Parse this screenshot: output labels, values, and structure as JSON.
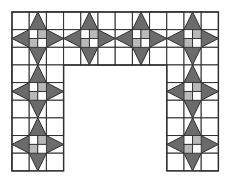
{
  "diagram": {
    "type": "quilt-border-pattern",
    "origin": [
      12,
      12
    ],
    "cols": 12,
    "rows": 9,
    "cell_w": 17.2,
    "cell_h": 17.65,
    "opening": {
      "col_start": 3,
      "col_end": 9,
      "row_start": 3,
      "row_end": 9
    },
    "colors": {
      "background": "#ffffff",
      "line": "#2e2e2e",
      "star": "#6b6b6b",
      "light_gray": "#b9b9b9"
    },
    "stars": [
      {
        "row": 1,
        "col": 1
      },
      {
        "row": 1,
        "col": 4
      },
      {
        "row": 1,
        "col": 7
      },
      {
        "row": 1,
        "col": 10
      },
      {
        "row": 4,
        "col": 1
      },
      {
        "row": 7,
        "col": 1
      },
      {
        "row": 4,
        "col": 10
      },
      {
        "row": 7,
        "col": 10
      }
    ],
    "star_center_patch": "diag-b",
    "four_patches": [
      {
        "row": 0,
        "col": 2,
        "pattern": "diag-b"
      },
      {
        "row": 0,
        "col": 3,
        "pattern": "diag-a"
      },
      {
        "row": 0,
        "col": 8,
        "pattern": "diag-b"
      },
      {
        "row": 0,
        "col": 9,
        "pattern": "diag-a"
      },
      {
        "row": 2,
        "col": 0,
        "pattern": "diag-b"
      },
      {
        "row": 2,
        "col": 5,
        "pattern": "diag-b"
      },
      {
        "row": 2,
        "col": 6,
        "pattern": "diag-a"
      },
      {
        "row": 2,
        "col": 11,
        "pattern": "diag-a"
      },
      {
        "row": 3,
        "col": 0,
        "pattern": "diag-a"
      },
      {
        "row": 3,
        "col": 11,
        "pattern": "diag-b"
      },
      {
        "row": 5,
        "col": 2,
        "pattern": "diag-b"
      },
      {
        "row": 6,
        "col": 2,
        "pattern": "diag-a"
      },
      {
        "row": 5,
        "col": 9,
        "pattern": "diag-a"
      },
      {
        "row": 6,
        "col": 9,
        "pattern": "diag-b"
      },
      {
        "row": 8,
        "col": 0,
        "pattern": "diag-b"
      },
      {
        "row": 8,
        "col": 11,
        "pattern": "diag-a"
      }
    ]
  }
}
